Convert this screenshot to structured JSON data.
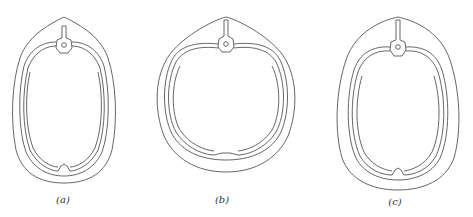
{
  "figures": [
    {
      "id": "a",
      "label": "(a)",
      "description": "Cross-section, elongated oval"
    },
    {
      "id": "b",
      "label": "(b)",
      "description": "Cross-section, broad heart/rounded shape"
    },
    {
      "id": "c",
      "label": "(c)",
      "description": "Cross-section, wide oval"
    }
  ],
  "colors": {
    "stroke": "#555555",
    "background": "#ffffff"
  }
}
